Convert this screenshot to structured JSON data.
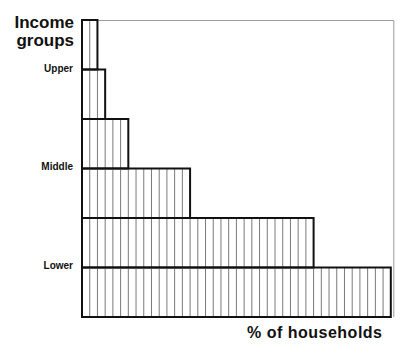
{
  "chart_data": {
    "type": "bar",
    "orientation": "horizontal",
    "title": "",
    "ylabel": "Income groups",
    "xlabel": "% of households",
    "categories": [
      "Upper (top)",
      "Upper",
      "Upper-middle",
      "Middle",
      "Lower-middle",
      "Lower"
    ],
    "category_labels_shown": [
      "Upper",
      "Middle",
      "Lower"
    ],
    "values": [
      2,
      3,
      6,
      14,
      30,
      40
    ],
    "units": "number of striped columns (% of households, approx.)",
    "xlim": [
      0,
      40
    ],
    "grid": false,
    "legend": null,
    "style": "stepped vertical-hatched bars, stacked top to bottom from highest to lowest income"
  },
  "labels": {
    "title_line1": "Income",
    "title_line2": "groups",
    "upper": "Upper",
    "middle": "Middle",
    "lower": "Lower",
    "xlabel": "% of households"
  },
  "colors": {
    "bar_outline": "#111111",
    "stripe": "#7a7a7a",
    "frame": "#9a9a9a",
    "background": "#ffffff"
  }
}
